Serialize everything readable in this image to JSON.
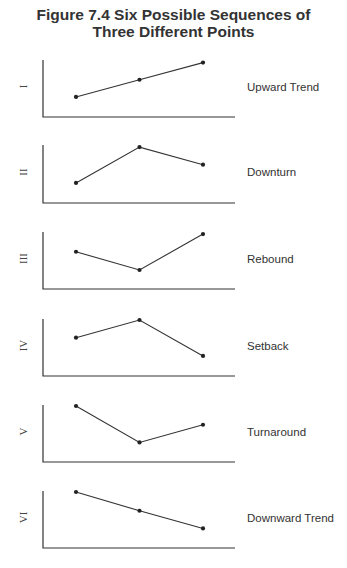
{
  "title": {
    "line1": "Figure 7.4  Six Possible Sequences of",
    "line2": "Three Different Points"
  },
  "chart_data": {
    "type": "line",
    "title": "Figure 7.4 Six Possible Sequences of Three Different Points",
    "xlabel": "",
    "ylabel": "",
    "grid": false,
    "legend": "none",
    "x": [
      1,
      2,
      3
    ],
    "note": "Schematic panels with unlabeled axes; values are relative heights (0 = axis baseline, 10 = top of axis).",
    "panels": [
      {
        "numeral": "I",
        "name": "Upward Trend",
        "values": [
          3.3,
          6.5,
          9.7
        ]
      },
      {
        "numeral": "II",
        "name": "Downturn",
        "values": [
          3.3,
          9.8,
          6.6
        ]
      },
      {
        "numeral": "III",
        "name": "Rebound",
        "values": [
          6.5,
          3.1,
          9.8
        ]
      },
      {
        "numeral": "IV",
        "name": "Setback",
        "values": [
          6.7,
          10.0,
          3.3
        ]
      },
      {
        "numeral": "V",
        "name": "Turnaround",
        "values": [
          10.0,
          3.2,
          6.5
        ]
      },
      {
        "numeral": "VI",
        "name": "Downward Trend",
        "values": [
          10.0,
          6.5,
          3.2
        ]
      }
    ]
  },
  "colors": {
    "ink": "#333333",
    "background": "#ffffff"
  }
}
